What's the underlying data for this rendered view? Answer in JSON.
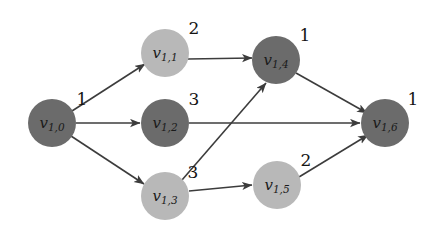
{
  "figure": {
    "type": "directed-graph",
    "width": 433,
    "height": 237,
    "background_color": "#ffffff"
  },
  "palette": {
    "node_dark": "#6b6b6b",
    "node_light": "#b8b8b8",
    "edge_color": "#3c3c3c",
    "text_color": "#141414"
  },
  "nodes": [
    {
      "id": "v10",
      "label_base": "v",
      "label_sub": "1,0",
      "weight": "1",
      "shade": "dark",
      "color": "#6b6b6b",
      "cx": 52,
      "cy": 123,
      "r": 24,
      "weight_x": 82,
      "weight_y": 100
    },
    {
      "id": "v11",
      "label_base": "v",
      "label_sub": "1,1",
      "weight": "2",
      "shade": "light",
      "color": "#b8b8b8",
      "cx": 165,
      "cy": 53,
      "r": 24,
      "weight_x": 194,
      "weight_y": 29
    },
    {
      "id": "v12",
      "label_base": "v",
      "label_sub": "1,2",
      "weight": "3",
      "shade": "dark",
      "color": "#6b6b6b",
      "cx": 165,
      "cy": 123,
      "r": 24,
      "weight_x": 194,
      "weight_y": 100
    },
    {
      "id": "v13",
      "label_base": "v",
      "label_sub": "1,3",
      "weight": "3",
      "shade": "light",
      "color": "#b8b8b8",
      "cx": 165,
      "cy": 196,
      "r": 24,
      "weight_x": 193,
      "weight_y": 173
    },
    {
      "id": "v14",
      "label_base": "v",
      "label_sub": "1,4",
      "weight": "1",
      "shade": "dark",
      "color": "#6b6b6b",
      "cx": 276,
      "cy": 60,
      "r": 24,
      "weight_x": 305,
      "weight_y": 36
    },
    {
      "id": "v15",
      "label_base": "v",
      "label_sub": "1,5",
      "weight": "2",
      "shade": "light",
      "color": "#b8b8b8",
      "cx": 277,
      "cy": 185,
      "r": 24,
      "weight_x": 306,
      "weight_y": 161
    },
    {
      "id": "v16",
      "label_base": "v",
      "label_sub": "1,6",
      "weight": "1",
      "shade": "dark",
      "color": "#6b6b6b",
      "cx": 385,
      "cy": 123,
      "r": 24,
      "weight_x": 413,
      "weight_y": 100
    }
  ],
  "edges": [
    {
      "id": "e-v10-v11",
      "from": "v10",
      "to": "v11",
      "x1": 72,
      "y1": 111,
      "x2": 145,
      "y2": 64
    },
    {
      "id": "e-v10-v12",
      "from": "v10",
      "to": "v12",
      "x1": 76,
      "y1": 123,
      "x2": 140,
      "y2": 123
    },
    {
      "id": "e-v10-v13",
      "from": "v10",
      "to": "v13",
      "x1": 71,
      "y1": 136,
      "x2": 144,
      "y2": 184
    },
    {
      "id": "e-v11-v14",
      "from": "v11",
      "to": "v14",
      "x1": 188,
      "y1": 59,
      "x2": 252,
      "y2": 58
    },
    {
      "id": "e-v12-v16",
      "from": "v12",
      "to": "v16",
      "x1": 189,
      "y1": 123,
      "x2": 360,
      "y2": 123
    },
    {
      "id": "e-v13-v14",
      "from": "v13",
      "to": "v14",
      "x1": 182,
      "y1": 180,
      "x2": 266,
      "y2": 83
    },
    {
      "id": "e-v13-v15",
      "from": "v13",
      "to": "v15",
      "x1": 189,
      "y1": 191,
      "x2": 252,
      "y2": 185
    },
    {
      "id": "e-v14-v16",
      "from": "v14",
      "to": "v16",
      "x1": 296,
      "y1": 73,
      "x2": 367,
      "y2": 113
    },
    {
      "id": "e-v15-v16",
      "from": "v15",
      "to": "v16",
      "x1": 299,
      "y1": 177,
      "x2": 368,
      "y2": 135
    }
  ]
}
